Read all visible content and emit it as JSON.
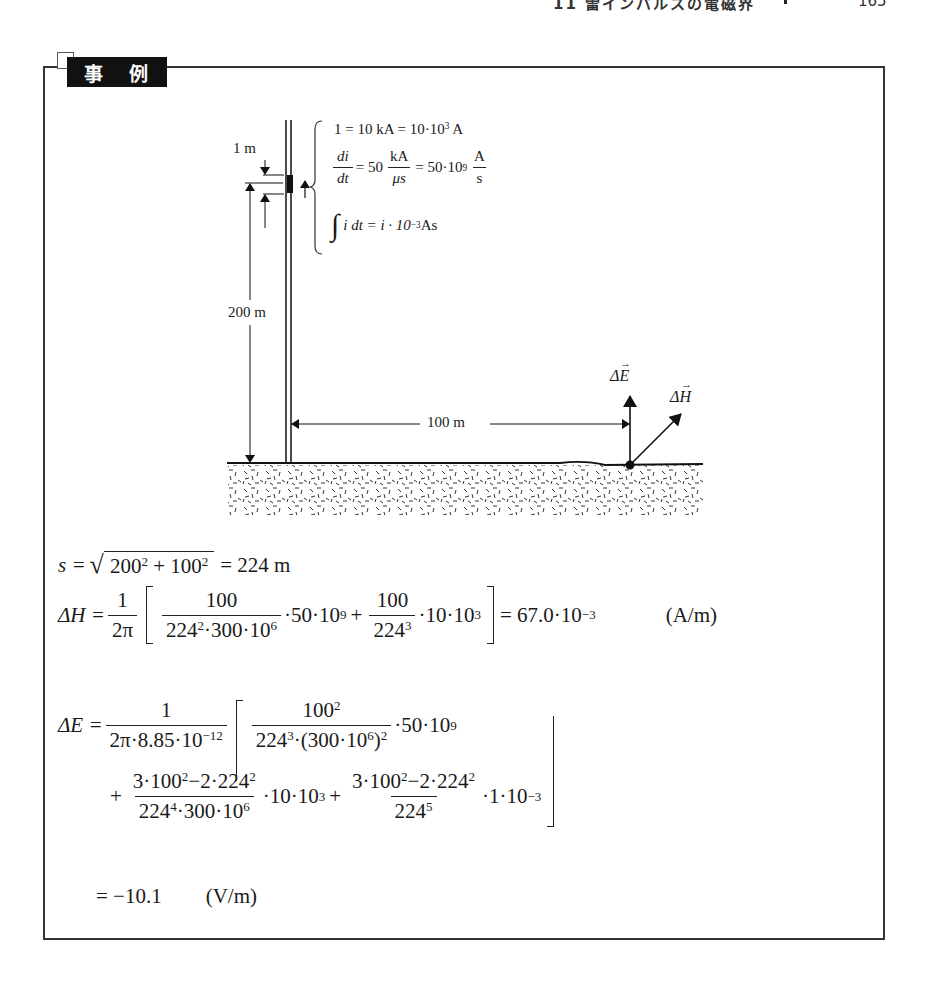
{
  "page_header": {
    "running_title": "11 雷インパルスの電磁界",
    "page_number": "165"
  },
  "example_box": {
    "tag_label": "事 例"
  },
  "diagram": {
    "tower_height_label": "200 m",
    "segment_length_label": "1 m",
    "distance_label": "100 m",
    "e_vector_label": "ΔE",
    "h_vector_label": "ΔH",
    "given": {
      "line1": {
        "lhs": "1 = 10 kA = 10·10",
        "exp": "3",
        "unit": " A"
      },
      "line2": {
        "num1": "di",
        "den1": "dt",
        "mid": "= 50",
        "num2": "kA",
        "den2": "μs",
        "mid2": "= 50·10",
        "exp": "9",
        "num3": "A",
        "den3": "s"
      },
      "line3": {
        "integral": "∫",
        "body": "i dt = i · 10",
        "exp": "−3",
        "unit": " As"
      }
    }
  },
  "equations": {
    "s": {
      "lhs": "s =",
      "radical": "√",
      "radicand_a": "200",
      "exp_a": "2",
      "plus": "+",
      "radicand_b": "100",
      "exp_b": "2",
      "result": "= 224 m"
    },
    "dH": {
      "lhs": "ΔH =",
      "pre_num": "1",
      "pre_den": "2π",
      "t1_num": "100",
      "t1_den_a": "224",
      "t1_den_a_exp": "2",
      "t1_den_b": "·300·10",
      "t1_den_b_exp": "6",
      "t1_mult": "·50·10",
      "t1_mult_exp": "9",
      "plus": "+",
      "t2_num": "100",
      "t2_den": "224",
      "t2_den_exp": "3",
      "t2_mult": "·10·10",
      "t2_mult_exp": "3",
      "result": "= 67.0·10",
      "result_exp": "−3",
      "unit": "(A/m)"
    },
    "dE": {
      "lhs": "ΔE =",
      "pre_num": "1",
      "pre_den": "2π·8.85·10",
      "pre_den_exp": "−12",
      "t1_num": "100",
      "t1_num_exp": "2",
      "t1_den_a": "224",
      "t1_den_a_exp": "3",
      "t1_den_b": "·(300·10",
      "t1_den_b_exp": "6",
      "t1_den_c": ")",
      "t1_den_c_exp": "2",
      "t1_mult": "·50·10",
      "t1_mult_exp": "9",
      "plus": "+",
      "t2_num_a": "3·100",
      "t2_num_a_exp": "2",
      "t2_num_b": "−2·224",
      "t2_num_b_exp": "2",
      "t2_den_a": "224",
      "t2_den_a_exp": "4",
      "t2_den_b": "·300·10",
      "t2_den_b_exp": "6",
      "t2_mult": "·10·10",
      "t2_mult_exp": "3",
      "t3_num_a": "3·100",
      "t3_num_a_exp": "2",
      "t3_num_b": "−2·224",
      "t3_num_b_exp": "2",
      "t3_den": "224",
      "t3_den_exp": "5",
      "t3_mult": "·1·10",
      "t3_mult_exp": "−3",
      "result": "= −10.1",
      "unit": "(V/m)"
    }
  }
}
